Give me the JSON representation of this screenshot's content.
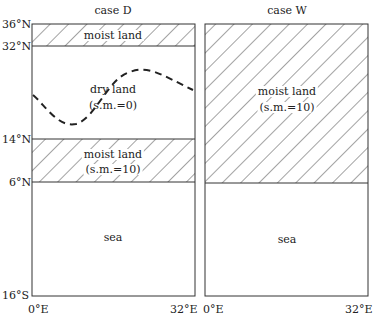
{
  "panels": [
    {
      "title": "case D",
      "regions": [
        {
          "label": "moist land",
          "sub": "",
          "from_lat": "36°N",
          "to_lat": "32°N",
          "hatched": true
        },
        {
          "label": "dry land",
          "sub": "(s.m.=0)",
          "from_lat": "32°N",
          "to_lat": "14°N",
          "hatched": false
        },
        {
          "label": "moist land",
          "sub": "(s.m.=10)",
          "from_lat": "14°N",
          "to_lat": "6°N",
          "hatched": true
        },
        {
          "label": "sea",
          "sub": "",
          "from_lat": "6°N",
          "to_lat": "16°S",
          "hatched": false
        }
      ],
      "y_ticks": [
        "36°N",
        "32°N",
        "14°N",
        "6°N",
        "16°S"
      ],
      "x_ticks": [
        "0°E",
        "32°E"
      ]
    },
    {
      "title": "case W",
      "regions": [
        {
          "label": "moist land",
          "sub": "(s.m.=10)",
          "from_lat": "36°N",
          "to_lat": "6°N",
          "hatched": true
        },
        {
          "label": "sea",
          "sub": "",
          "from_lat": "6°N",
          "to_lat": "16°S",
          "hatched": false
        }
      ],
      "x_ticks": [
        "0°E",
        "32°E"
      ]
    }
  ]
}
